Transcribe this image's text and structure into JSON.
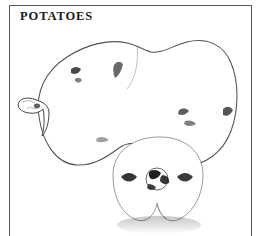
{
  "plate": {
    "caption": "POTATOES",
    "background_color": "#ffffff",
    "frame_color": "#55585c",
    "ink_color": "#2b2b2b",
    "technique": "stipple / pen-and-ink line drawing",
    "subject": "two potato tubers",
    "figure_elements": [
      {
        "name": "large-potato",
        "description": "large two-lobed tuber occupying the upper portion of the plate",
        "features": [
          "lobed saddle-shaped top outline",
          "stippled shading heaviest along lower-left and right margins",
          "several dark eye depressions"
        ]
      },
      {
        "name": "potato-sprout",
        "description": "small pointed sprout/bud projecting from the left side of the large tuber"
      },
      {
        "name": "small-potato",
        "description": "smaller rounded tuber in front of and overlapping the large tuber",
        "features": [
          "three dark eye clusters across the middle",
          "soft cast shadow at the base",
          "notched bottom lobes"
        ]
      }
    ]
  }
}
